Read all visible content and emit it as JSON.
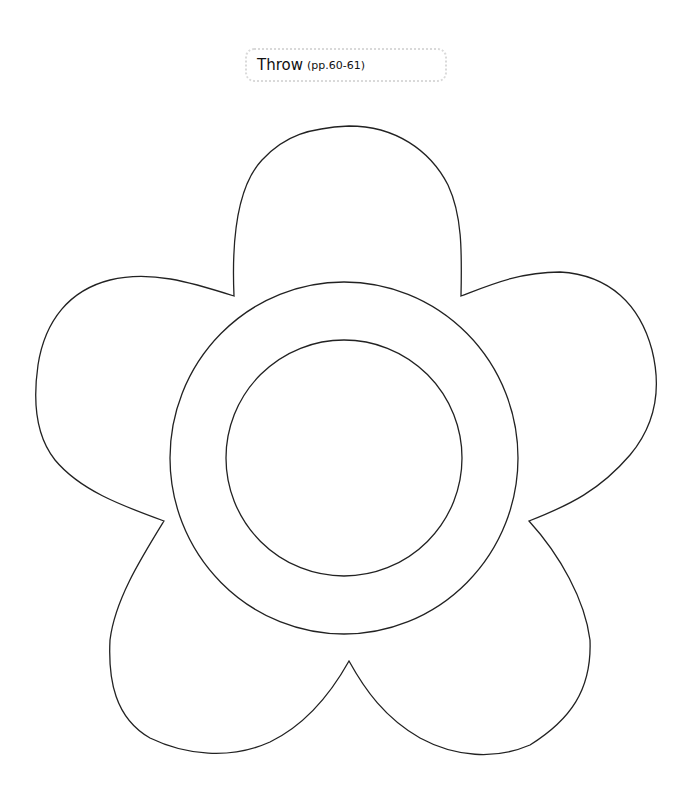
{
  "template": {
    "title": "Throw",
    "pages": "(pp.60-61)"
  },
  "colors": {
    "outline": "#222222",
    "label_border": "#d9d9d9",
    "background": "#ffffff"
  },
  "shape": {
    "type": "flower",
    "petals": 5,
    "center": [
      344,
      458
    ],
    "outer_ring_radius": 175,
    "inner_circle_radius": 118
  }
}
